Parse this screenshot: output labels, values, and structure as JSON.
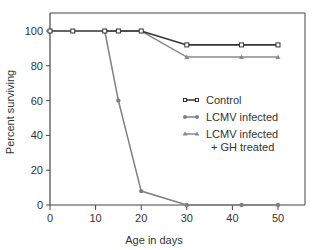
{
  "chart_data": {
    "type": "line",
    "title": "",
    "xlabel": "Age in days",
    "ylabel": "Percent surviving",
    "xlim": [
      0,
      55
    ],
    "ylim": [
      0,
      108
    ],
    "xticks": [
      0,
      10,
      20,
      30,
      40,
      50
    ],
    "yticks": [
      0,
      20,
      40,
      60,
      80,
      100
    ],
    "grid": false,
    "legend_position": "center-right",
    "series": [
      {
        "name": "Control",
        "marker": "open-square",
        "color": "#333333",
        "x": [
          0,
          5,
          12,
          15,
          20,
          30,
          42,
          50
        ],
        "y": [
          100,
          100,
          100,
          100,
          100,
          92,
          92,
          92
        ]
      },
      {
        "name": "LCMV infected",
        "marker": "filled-circle",
        "color": "#808080",
        "x": [
          12,
          15,
          20,
          30,
          42,
          50
        ],
        "y": [
          100,
          60,
          8,
          0,
          0,
          0
        ]
      },
      {
        "name": "LCMV infected + GH treated",
        "marker": "filled-triangle",
        "color": "#8a8a8a",
        "x": [
          12,
          20,
          30,
          42,
          50
        ],
        "y": [
          100,
          100,
          85,
          85,
          85
        ]
      }
    ]
  },
  "legend": {
    "items": [
      {
        "line1": "Control",
        "line2": ""
      },
      {
        "line1": "LCMV infected",
        "line2": ""
      },
      {
        "line1": "LCMV infected",
        "line2": "+ GH treated"
      }
    ]
  },
  "axes": {
    "xlabel": "Age in days",
    "ylabel": "Percent surviving",
    "xtick_labels": [
      "0",
      "10",
      "20",
      "30",
      "40",
      "50"
    ],
    "ytick_labels": [
      "0",
      "20",
      "40",
      "60",
      "80",
      "100"
    ]
  }
}
